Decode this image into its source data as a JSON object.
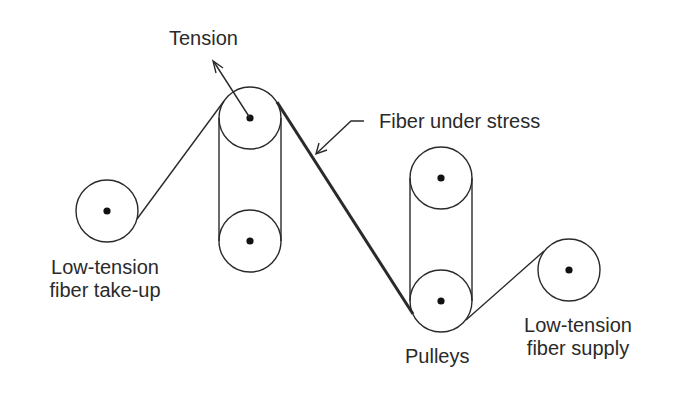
{
  "diagram": {
    "colors": {
      "stroke": "#2a2a2a",
      "background": "#ffffff"
    },
    "labels": {
      "tension": "Tension",
      "fiber_under_stress": "Fiber under stress",
      "takeup_line1": "Low-tension",
      "takeup_line2": "fiber take-up",
      "pulleys": "Pulleys",
      "supply_line1": "Low-tension",
      "supply_line2": "fiber supply"
    },
    "components": [
      {
        "name": "take-up-spool",
        "cx": 107,
        "cy": 211,
        "r": 31
      },
      {
        "name": "tension-pulley-top",
        "cx": 250,
        "cy": 118,
        "r": 31
      },
      {
        "name": "tension-pulley-bottom",
        "cx": 250,
        "cy": 241,
        "r": 31
      },
      {
        "name": "guide-pulley-top",
        "cx": 441,
        "cy": 178,
        "r": 31
      },
      {
        "name": "guide-pulley-bottom",
        "cx": 441,
        "cy": 301,
        "r": 31
      },
      {
        "name": "supply-spool",
        "cx": 569,
        "cy": 270,
        "r": 31
      }
    ]
  }
}
